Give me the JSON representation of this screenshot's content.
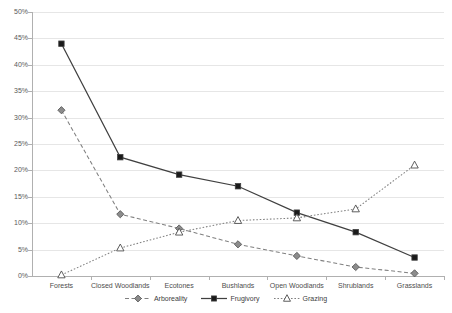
{
  "chart_data": {
    "type": "line",
    "title": "",
    "xlabel": "",
    "ylabel": "",
    "ylim": [
      0,
      50
    ],
    "ytick_step": 5,
    "ytick_labels": [
      "0%",
      "5%",
      "10%",
      "15%",
      "20%",
      "25%",
      "30%",
      "35%",
      "40%",
      "45%",
      "50%"
    ],
    "grid": true,
    "legend_position": "bottom",
    "categories": [
      "Forests",
      "Closed Woodlands",
      "Ecotones",
      "Bushlands",
      "Open Woodlands",
      "Shrublands",
      "Grasslands"
    ],
    "series": [
      {
        "name": "Arboreality",
        "marker": "diamond",
        "line_style": "dashed",
        "color": "#808080",
        "marker_fill": "#8c8c8c",
        "values": [
          31.4,
          11.7,
          9.0,
          6.0,
          3.8,
          1.7,
          0.5
        ]
      },
      {
        "name": "Frugivory",
        "marker": "square",
        "line_style": "solid",
        "color": "#404040",
        "marker_fill": "#1a1a1a",
        "values": [
          44.0,
          22.5,
          19.2,
          17.0,
          12.0,
          8.3,
          3.5
        ]
      },
      {
        "name": "Grazing",
        "marker": "triangle",
        "line_style": "dotted",
        "color": "#808080",
        "marker_fill": "#ffffff",
        "values": [
          0.2,
          5.3,
          8.3,
          10.5,
          11.0,
          12.7,
          21.0
        ]
      }
    ]
  },
  "legend": {
    "items": [
      "Arboreality",
      "Frugivory",
      "Grazing"
    ]
  },
  "axes": {
    "y_ticks": [
      "50%",
      "45%",
      "40%",
      "35%",
      "30%",
      "25%",
      "20%",
      "15%",
      "10%",
      "5%",
      "0%"
    ],
    "x_ticks": [
      "Forests",
      "Closed Woodlands",
      "Ecotones",
      "Bushlands",
      "Open Woodlands",
      "Shrublands",
      "Grasslands"
    ]
  },
  "colors": {
    "grid": "#e6e6e6",
    "axis": "#b0b0b0",
    "text": "#4d4d4d",
    "frugivory": "#1a1a1a",
    "arboreality": "#8c8c8c",
    "grazing": "#808080"
  }
}
